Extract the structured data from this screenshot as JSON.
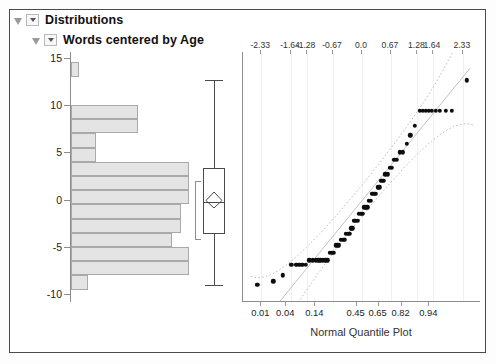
{
  "panel": {
    "level1_title": "Distributions",
    "level2_title": "Words centered by Age",
    "disclosure_icon": "triangle-icon",
    "combo_icon": "chevron-down-icon"
  },
  "chart_data": {
    "type": "histogram+boxplot+qqplot",
    "title": "Words centered by Age",
    "xlabel": "Normal Quantile Plot",
    "ylabel": "",
    "ylim": [
      -10.8,
      15.6
    ],
    "y_ticks": [
      "15",
      "10",
      "5",
      "0",
      "-5",
      "-10"
    ],
    "y_tick_values": [
      15,
      10,
      5,
      0,
      -5,
      -10
    ],
    "grid": false,
    "histogram": {
      "orientation": "horizontal",
      "bin_width": 1.5,
      "bins": [
        {
          "y_low": 13.0,
          "y_high": 14.5,
          "count": 1
        },
        {
          "y_low": 11.5,
          "y_high": 13.0,
          "count": 0
        },
        {
          "y_low": 10.0,
          "y_high": 11.5,
          "count": 0
        },
        {
          "y_low": 8.5,
          "y_high": 10.0,
          "count": 8
        },
        {
          "y_low": 7.0,
          "y_high": 8.5,
          "count": 8
        },
        {
          "y_low": 5.5,
          "y_high": 7.0,
          "count": 3
        },
        {
          "y_low": 4.0,
          "y_high": 5.5,
          "count": 3
        },
        {
          "y_low": 2.5,
          "y_high": 4.0,
          "count": 14
        },
        {
          "y_low": 1.0,
          "y_high": 2.5,
          "count": 14
        },
        {
          "y_low": -0.5,
          "y_high": 1.0,
          "count": 14
        },
        {
          "y_low": -2.0,
          "y_high": -0.5,
          "count": 13
        },
        {
          "y_low": -3.5,
          "y_high": -2.0,
          "count": 13
        },
        {
          "y_low": -5.0,
          "y_high": -3.5,
          "count": 12
        },
        {
          "y_low": -6.5,
          "y_high": -5.0,
          "count": 14
        },
        {
          "y_low": -8.0,
          "y_high": -6.5,
          "count": 14
        },
        {
          "y_low": -9.5,
          "y_high": -8.0,
          "count": 2
        }
      ]
    },
    "boxplot": {
      "min_whisker": -9.0,
      "q1": -3.6,
      "median": -0.2,
      "q3": 3.3,
      "max_whisker": 12.6,
      "mean": -0.1,
      "mean_marker": "diamond",
      "shortest_half_bracket": [
        -4.3,
        2.0
      ]
    },
    "qqplot": {
      "top_axis_label": "Normal Quantile",
      "top_ticks": [
        "-2.33",
        "-1.64",
        "-1.28",
        "-0.67",
        "0.0",
        "0.67",
        "1.28",
        "1.64",
        "2.33"
      ],
      "top_tick_values": [
        -2.33,
        -1.64,
        -1.28,
        -0.67,
        0.0,
        0.67,
        1.28,
        1.64,
        2.33
      ],
      "bottom_axis_label": "Normal Quantile Plot",
      "bottom_ticks": [
        "0.01",
        "0.04",
        "0.14",
        "0.45",
        "0.65",
        "0.82",
        "0.94"
      ],
      "bottom_tick_values": [
        0.01,
        0.04,
        0.14,
        0.45,
        0.65,
        0.82,
        0.94
      ],
      "xlim": [
        -2.75,
        2.75
      ],
      "reference_line": true,
      "confidence_bands": true,
      "points": [
        [
          -2.42,
          -9.0
        ],
        [
          -2.05,
          -8.6
        ],
        [
          -1.83,
          -8.0
        ],
        [
          -1.63,
          -6.9
        ],
        [
          -1.52,
          -6.9
        ],
        [
          -1.45,
          -6.9
        ],
        [
          -1.38,
          -6.9
        ],
        [
          -1.3,
          -6.9
        ],
        [
          -1.22,
          -6.4
        ],
        [
          -1.14,
          -6.4
        ],
        [
          -1.07,
          -6.4
        ],
        [
          -1.01,
          -6.4
        ],
        [
          -0.96,
          -6.4
        ],
        [
          -0.9,
          -6.4
        ],
        [
          -0.85,
          -6.4
        ],
        [
          -0.8,
          -6.4
        ],
        [
          -0.75,
          -5.6
        ],
        [
          -0.7,
          -5.6
        ],
        [
          -0.66,
          -5.6
        ],
        [
          -0.61,
          -4.8
        ],
        [
          -0.57,
          -4.8
        ],
        [
          -0.53,
          -4.8
        ],
        [
          -0.49,
          -4.2
        ],
        [
          -0.45,
          -4.2
        ],
        [
          -0.41,
          -4.2
        ],
        [
          -0.37,
          -3.6
        ],
        [
          -0.33,
          -3.6
        ],
        [
          -0.29,
          -3.6
        ],
        [
          -0.25,
          -3.0
        ],
        [
          -0.22,
          -3.0
        ],
        [
          -0.18,
          -2.2
        ],
        [
          -0.14,
          -2.2
        ],
        [
          -0.1,
          -2.2
        ],
        [
          -0.07,
          -1.5
        ],
        [
          -0.03,
          -1.5
        ],
        [
          0.01,
          -1.5
        ],
        [
          0.05,
          -0.8
        ],
        [
          0.09,
          -0.8
        ],
        [
          0.12,
          -0.8
        ],
        [
          0.16,
          -0.1
        ],
        [
          0.2,
          -0.1
        ],
        [
          0.24,
          0.6
        ],
        [
          0.28,
          0.6
        ],
        [
          0.32,
          0.6
        ],
        [
          0.36,
          1.3
        ],
        [
          0.4,
          1.3
        ],
        [
          0.45,
          2.0
        ],
        [
          0.49,
          2.0
        ],
        [
          0.54,
          2.7
        ],
        [
          0.59,
          2.7
        ],
        [
          0.64,
          3.4
        ],
        [
          0.69,
          3.4
        ],
        [
          0.75,
          4.2
        ],
        [
          0.81,
          4.2
        ],
        [
          0.88,
          5.0
        ],
        [
          0.95,
          5.0
        ],
        [
          1.03,
          5.9
        ],
        [
          1.12,
          6.8
        ],
        [
          1.22,
          7.8
        ],
        [
          1.34,
          9.4
        ],
        [
          1.41,
          9.4
        ],
        [
          1.48,
          9.4
        ],
        [
          1.55,
          9.4
        ],
        [
          1.62,
          9.4
        ],
        [
          1.7,
          9.4
        ],
        [
          1.8,
          9.4
        ],
        [
          1.94,
          9.4
        ],
        [
          2.08,
          9.4
        ],
        [
          2.42,
          12.6
        ]
      ]
    }
  },
  "colors": {
    "bar_fill": "#e4e4e4",
    "bar_stroke": "#a9a9a9",
    "point": "#0d0d0d",
    "axis": "#8d8d8d",
    "frame": "#4a4a4a",
    "band": "#b9b9b9"
  }
}
